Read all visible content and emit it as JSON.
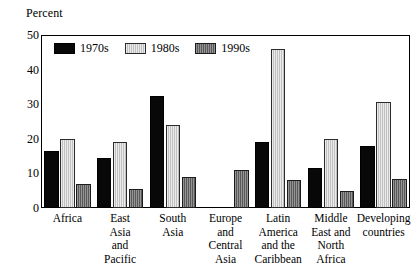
{
  "chart_data": {
    "type": "bar",
    "title": "",
    "ylabel": "Percent",
    "xlabel": "",
    "ylim": [
      0,
      50
    ],
    "yticks": [
      0,
      10,
      20,
      30,
      40,
      50
    ],
    "grid": false,
    "legend_position": "top-left inside plot",
    "categories": [
      "Africa",
      "East Asia and Pacific",
      "South Asia",
      "Europe and Central Asia",
      "Latin America and the Caribbean",
      "Middle East and North Africa",
      "Developing countries"
    ],
    "category_lines": [
      [
        "Africa"
      ],
      [
        "East",
        "Asia",
        "and",
        "Pacific"
      ],
      [
        "South",
        "Asia"
      ],
      [
        "Europe",
        "and",
        "Central",
        "Asia"
      ],
      [
        "Latin",
        "America",
        "and the",
        "Caribbean"
      ],
      [
        "Middle",
        "East and",
        "North",
        "Africa"
      ],
      [
        "Developing",
        "countries"
      ]
    ],
    "series": [
      {
        "name": "1970s",
        "color": "#080808",
        "values": [
          16.5,
          14.5,
          32.5,
          null,
          19.0,
          11.5,
          18.0
        ]
      },
      {
        "name": "1980s",
        "color": "#d2d2d2",
        "values": [
          20.0,
          19.0,
          24.0,
          null,
          46.0,
          20.0,
          30.5
        ]
      },
      {
        "name": "1990s",
        "color": "#6e6e6e",
        "values": [
          7.0,
          5.5,
          9.0,
          11.0,
          8.0,
          5.0,
          8.5
        ]
      }
    ]
  },
  "legend": {
    "items": [
      {
        "label": "1970s",
        "key": "s1970"
      },
      {
        "label": "1980s",
        "key": "s1980"
      },
      {
        "label": "1990s",
        "key": "s1990"
      }
    ]
  },
  "ytick_labels": [
    "50",
    "40",
    "30",
    "20",
    "10",
    "0"
  ]
}
